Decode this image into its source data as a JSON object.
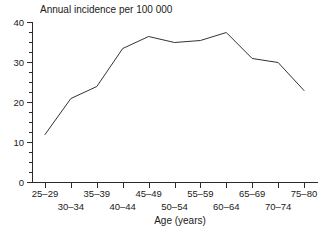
{
  "chart_data": {
    "type": "line",
    "title": "Annual incidence per 100 000",
    "xlabel": "Age (years)",
    "ylabel": "",
    "categories": [
      "25–29",
      "30–34",
      "35–39",
      "40–44",
      "45–49",
      "50–54",
      "55–59",
      "60–64",
      "65–69",
      "70–74",
      "75–80"
    ],
    "values": [
      12,
      21,
      24,
      33.5,
      36.5,
      35,
      35.5,
      37.5,
      31,
      30,
      23
    ],
    "ylim": [
      0,
      40
    ],
    "y_ticks": [
      "0",
      "10",
      "20",
      "30",
      "40"
    ],
    "y_tick_values": [
      0,
      10,
      20,
      30,
      40
    ],
    "y_minor_step": 2.5,
    "grid": false,
    "legend": "none",
    "series": [
      {
        "name": "Annual incidence per 100 000",
        "values": [
          12,
          21,
          24,
          33.5,
          36.5,
          35,
          35.5,
          37.5,
          31,
          30,
          23
        ]
      }
    ]
  },
  "labels": {
    "title": "Annual incidence per 100 000",
    "x_axis_title": "Age (years)",
    "y_tick_0": "0",
    "y_tick_10": "10",
    "y_tick_20": "20",
    "y_tick_30": "30",
    "y_tick_40": "40",
    "x_row_top": [
      "25–29",
      "35–39",
      "45–49",
      "55–59",
      "65–69",
      "75–80"
    ],
    "x_row_bottom": [
      "30–34",
      "40–44",
      "50–54",
      "60–64",
      "70–74"
    ]
  },
  "colors": {
    "line": "#333333",
    "axis": "#2b2b2b",
    "text": "#1a1a1a",
    "background": "#ffffff"
  }
}
